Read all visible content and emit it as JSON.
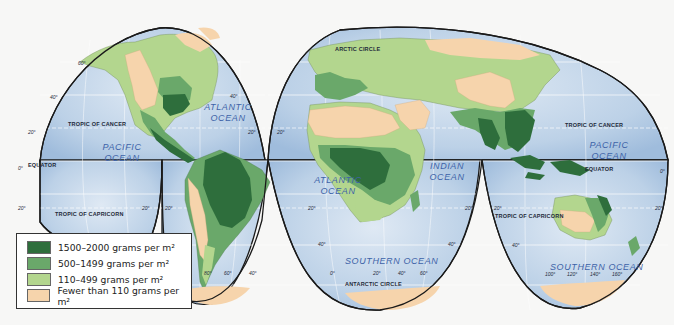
{
  "legend": {
    "items": [
      {
        "label": "1500–2000 grams per m²",
        "color": "#2e6e3c"
      },
      {
        "label": "500–1499 grams per m²",
        "color": "#6aa86a"
      },
      {
        "label": "110–499 grams per m²",
        "color": "#b3d68e"
      },
      {
        "label": "Fewer than 110 grams per m²",
        "color": "#f6d4ac"
      }
    ]
  },
  "oceans": {
    "atlantic_north": "ATLANTIC OCEAN",
    "pacific_east": "PACIFIC OCEAN",
    "atlantic_south": "ATLANTIC OCEAN",
    "indian": "INDIAN OCEAN",
    "pacific_west": "PACIFIC OCEAN",
    "southern_africa": "SOUTHERN OCEAN",
    "southern_australia": "SOUTHERN OCEAN"
  },
  "lines": {
    "arctic_circle": "ARCTIC CIRCLE",
    "tropic_cancer_left": "TROPIC OF CANCER",
    "tropic_cancer_right": "TROPIC OF CANCER",
    "equator_left": "EQUATOR",
    "equator_right": "EQUATOR",
    "tropic_capricorn_left": "TROPIC OF CAPRICORN",
    "tropic_capricorn_right": "TROPIC OF CAPRICORN",
    "antarctic_circle": "ANTARCTIC CIRCLE"
  },
  "degrees": {
    "lat60": "60°",
    "lat40": "40°",
    "lat20": "20°",
    "lat0": "0°",
    "lon80": "80°",
    "lon60": "60°",
    "lon40": "40°",
    "lon20": "20°",
    "lon0": "0°",
    "lon100": "100°",
    "lon120": "120°",
    "lon140": "140°",
    "lon160": "160°"
  },
  "colors": {
    "ocean": "#b9cfe6",
    "ocean_light": "#dbe7f3",
    "graticule": "#ffffff",
    "outline": "#1a1a1a"
  }
}
